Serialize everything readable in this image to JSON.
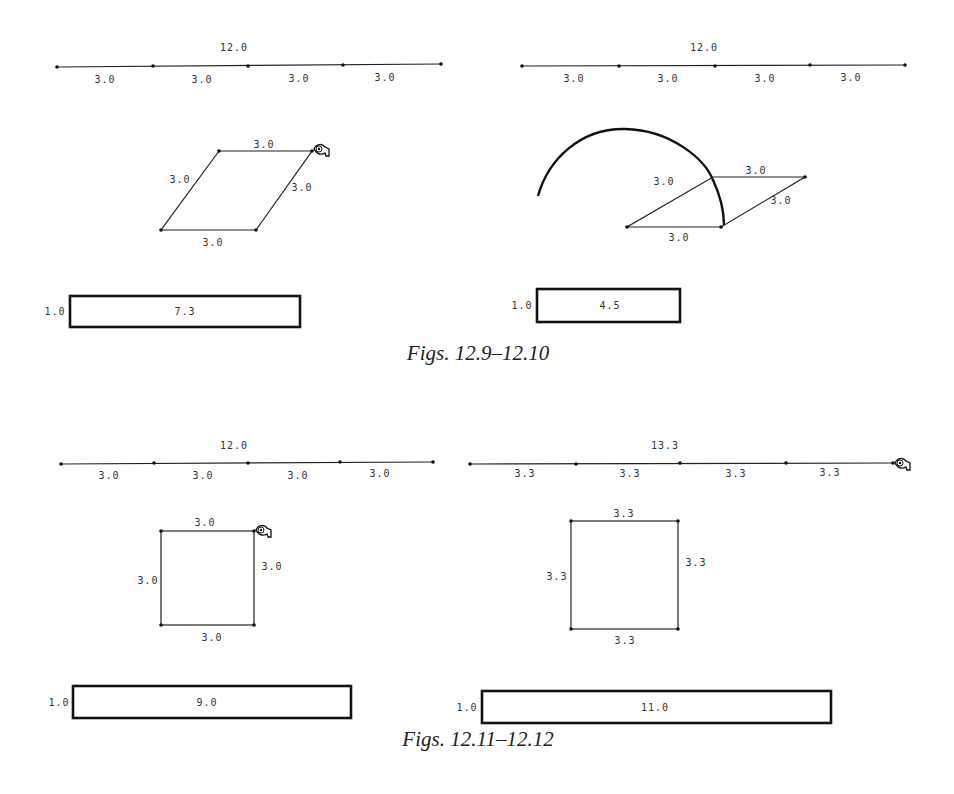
{
  "figures": [
    {
      "id": "12.9",
      "line": {
        "total_label": "12.0",
        "segment_labels": [
          "3.0",
          "3.0",
          "3.0",
          "3.0"
        ]
      },
      "shape": {
        "type": "rhombus",
        "side_labels": {
          "top": "3.0",
          "left": "3.0",
          "right": "3.0",
          "bottom": "3.0"
        },
        "cursor": "hand-cursor"
      },
      "bar": {
        "height_label": "1.0",
        "area_label": "7.3"
      }
    },
    {
      "id": "12.10",
      "line": {
        "total_label": "12.0",
        "segment_labels": [
          "3.0",
          "3.0",
          "3.0",
          "3.0"
        ]
      },
      "shape": {
        "type": "rhombus-with-arc",
        "side_labels": {
          "top": "3.0",
          "left": "3.0",
          "right": "3.0",
          "bottom": "3.0"
        }
      },
      "bar": {
        "height_label": "1.0",
        "area_label": "4.5"
      }
    },
    {
      "id": "12.11",
      "line": {
        "total_label": "12.0",
        "segment_labels": [
          "3.0",
          "3.0",
          "3.0",
          "3.0"
        ]
      },
      "shape": {
        "type": "square",
        "side_labels": {
          "top": "3.0",
          "left": "3.0",
          "right": "3.0",
          "bottom": "3.0"
        },
        "cursor": "hand-cursor"
      },
      "bar": {
        "height_label": "1.0",
        "area_label": "9.0"
      }
    },
    {
      "id": "12.12",
      "line": {
        "total_label": "13.3",
        "segment_labels": [
          "3.3",
          "3.3",
          "3.3",
          "3.3"
        ],
        "cursor": "hand-cursor"
      },
      "shape": {
        "type": "square",
        "side_labels": {
          "top": "3.3",
          "left": "3.3",
          "right": "3.3",
          "bottom": "3.3"
        }
      },
      "bar": {
        "height_label": "1.0",
        "area_label": "11.0"
      }
    }
  ],
  "captions": {
    "top": "Figs. 12.9–12.10",
    "bottom": "Figs. 12.11–12.12"
  }
}
